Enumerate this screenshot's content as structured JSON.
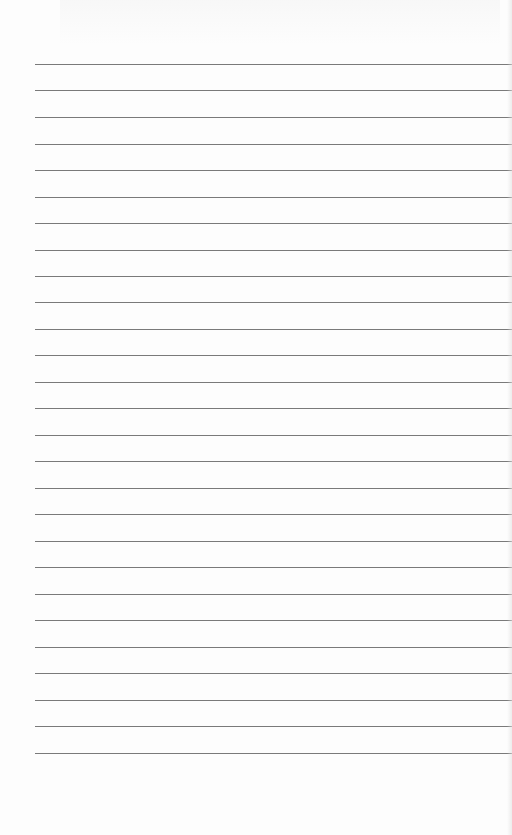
{
  "page": {
    "type": "blank-ruled-sheet",
    "background_color": "#fdfdfd",
    "rule_color": "#7a7a7a",
    "rule_left_x": 35,
    "rules_y": [
      64,
      90,
      117,
      144,
      170,
      197,
      223,
      250,
      276,
      302,
      329,
      355,
      382,
      408,
      435,
      461,
      488,
      514,
      541,
      567,
      594,
      620,
      647,
      673,
      700,
      726,
      753
    ],
    "rule_count": 27
  }
}
